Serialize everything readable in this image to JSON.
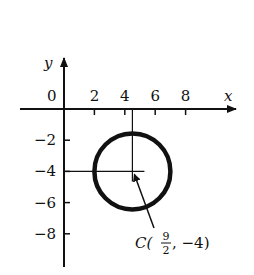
{
  "diagram": {
    "x_axis_label": "x",
    "y_axis_label": "y",
    "origin_label": "0",
    "x_ticks": [
      {
        "value": 2,
        "label": "2"
      },
      {
        "value": 4,
        "label": "4"
      },
      {
        "value": 6,
        "label": "6"
      },
      {
        "value": 8,
        "label": "8"
      }
    ],
    "y_ticks": [
      {
        "value": -2,
        "label": "−2"
      },
      {
        "value": -4,
        "label": "−4"
      },
      {
        "value": -6,
        "label": "−6"
      },
      {
        "value": -8,
        "label": "−8"
      }
    ],
    "circle": {
      "center_x": 4.5,
      "center_y": -4,
      "radius": 2.5
    },
    "center_label": {
      "prefix": "C(",
      "x_numerator": "9",
      "x_denominator": "2",
      "suffix": ", −4)"
    },
    "colors": {
      "ink": "#111111",
      "background": "#ffffff"
    }
  }
}
